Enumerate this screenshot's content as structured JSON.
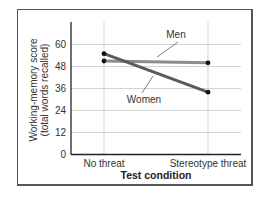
{
  "chart_data": {
    "type": "line",
    "title": "",
    "xlabel": "Test condition",
    "ylabel": "Working-memory score (total words recalled)",
    "ylabel_lines": [
      "Working-memory score",
      "(total words recalled)"
    ],
    "categories": [
      "No threat",
      "Stereotype threat"
    ],
    "series": [
      {
        "name": "Men",
        "values": [
          51,
          50
        ],
        "color": "#8c8c8c"
      },
      {
        "name": "Women",
        "values": [
          55,
          34
        ],
        "color": "#5a5a5a"
      }
    ],
    "yticks": [
      0,
      12,
      24,
      36,
      48,
      60
    ],
    "ytick_labels": [
      "0",
      "12",
      "24",
      "36",
      "48",
      "60"
    ],
    "ylim": [
      0,
      72
    ],
    "grid": true,
    "legend": "inline labels with leader lines"
  }
}
